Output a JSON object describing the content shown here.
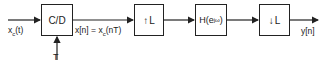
{
  "diagram": {
    "type": "signal-processing-block-diagram",
    "input": {
      "label_main": "x",
      "label_sub": "c",
      "label_arg": "(t)"
    },
    "blocks": [
      {
        "id": "cd",
        "label": "C/D"
      },
      {
        "id": "upsample",
        "arrow": "↑",
        "label": "L"
      },
      {
        "id": "filter",
        "label_main": "H(e",
        "label_sup": "jω",
        "label_tail": ")"
      },
      {
        "id": "downsample",
        "arrow": "↓",
        "label": "L"
      }
    ],
    "sampling_input": {
      "label": "T"
    },
    "intermediate_signal": {
      "label_pre": "x[n] = x",
      "label_sub": "c",
      "label_post": "(nT)"
    },
    "output": {
      "label": "y[n]"
    }
  }
}
